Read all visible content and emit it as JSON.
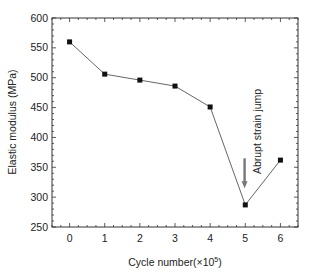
{
  "chart_data": {
    "type": "line",
    "title": "",
    "xlabel": "Cycle number(×10",
    "xlabel_sup": "5",
    "xlabel_close": ")",
    "ylabel": "Elastic modulus (MPa)",
    "x": [
      0,
      1,
      2,
      3,
      4,
      5,
      6
    ],
    "series": [
      {
        "name": "Elastic modulus",
        "values": [
          560,
          506,
          496,
          486,
          451,
          287,
          362
        ],
        "marker": "square",
        "color": "#555555"
      }
    ],
    "xlim": [
      -0.5,
      6.5
    ],
    "ylim": [
      250,
      600
    ],
    "xticks": [
      0,
      1,
      2,
      3,
      4,
      5,
      6
    ],
    "yticks": [
      250,
      300,
      350,
      400,
      450,
      500,
      550,
      600
    ],
    "grid": false,
    "legend": null,
    "annotations": [
      {
        "text": "Abrupt strain jump",
        "x": 5,
        "rotation": -90,
        "arrow": {
          "x": 4.98,
          "y_from": 365,
          "y_to": 315,
          "color": "#777777"
        }
      }
    ]
  }
}
